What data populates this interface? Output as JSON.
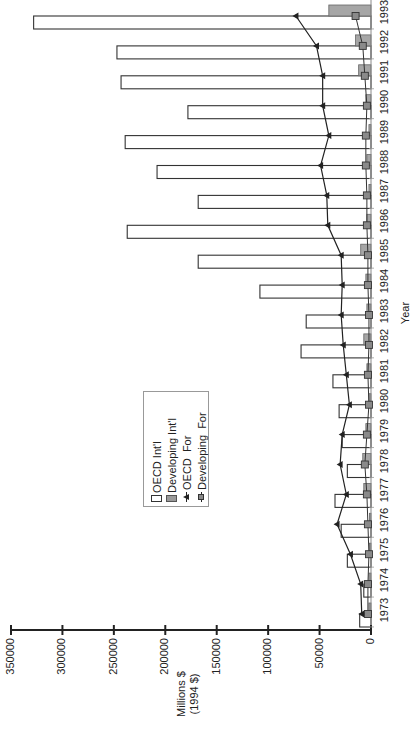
{
  "chart_data": {
    "type": "bar",
    "orientation": "rotated-90-ccw",
    "title": "",
    "xlabel": "Year",
    "ylabel": "Millions $ (1994 $)",
    "ylabel_line1": "Millions $",
    "ylabel_line2": "(1994 $)",
    "ylim": [
      0,
      350000
    ],
    "yticks": [
      0,
      50000,
      100000,
      150000,
      200000,
      250000,
      300000,
      350000
    ],
    "ytick_labels": [
      "0",
      "50000",
      "100000",
      "150000",
      "200000",
      "250000",
      "300000",
      "350000"
    ],
    "grid": false,
    "legend_position": "inside-center",
    "categories": [
      "1973",
      "1974",
      "1975",
      "1976",
      "1977",
      "1978",
      "1979",
      "1980",
      "1981",
      "1982",
      "1983",
      "1984",
      "1985",
      "1986",
      "1987",
      "1988",
      "1989",
      "1990",
      "1991",
      "1992",
      "1993"
    ],
    "series": [
      {
        "name": "OECD Int'l",
        "kind": "bar",
        "style": "open",
        "color": "#ffffff",
        "values": [
          11000,
          7000,
          23000,
          29000,
          35000,
          23000,
          28000,
          31000,
          37000,
          68000,
          63000,
          108000,
          168000,
          237000,
          168000,
          208000,
          239000,
          178000,
          243000,
          247000,
          328000
        ]
      },
      {
        "name": "Developing Int'l",
        "kind": "bar",
        "style": "filled",
        "color": "#9a9a9a",
        "values": [
          2000,
          2000,
          1500,
          1500,
          7000,
          8000,
          5000,
          2000,
          4000,
          7000,
          4000,
          5000,
          10000,
          4000,
          2000,
          4000,
          2000,
          5000,
          12000,
          15000,
          41000
        ]
      },
      {
        "name": "OECD For",
        "kind": "line",
        "marker": "triangle",
        "color": "#222222",
        "values": [
          9000,
          10000,
          20000,
          33000,
          24000,
          30000,
          28000,
          21000,
          24000,
          27000,
          29000,
          28000,
          29000,
          42000,
          43000,
          49000,
          41000,
          47000,
          47000,
          53000,
          73000
        ]
      },
      {
        "name": "Developing  For",
        "kind": "line",
        "marker": "square",
        "color": "#888888",
        "values": [
          3000,
          3000,
          2000,
          3000,
          4000,
          6000,
          4000,
          2000,
          3000,
          2000,
          2000,
          3000,
          3000,
          4000,
          4000,
          5000,
          5000,
          4000,
          6000,
          8000,
          15000
        ]
      }
    ]
  },
  "legend": {
    "items": [
      {
        "label": "OECD Int'l",
        "symbol": "open-bar"
      },
      {
        "label": "Developing Int'l",
        "symbol": "filled-bar"
      },
      {
        "label": "OECD  For",
        "symbol": "line-triangle"
      },
      {
        "label": "Developing  For",
        "symbol": "line-square"
      }
    ]
  }
}
